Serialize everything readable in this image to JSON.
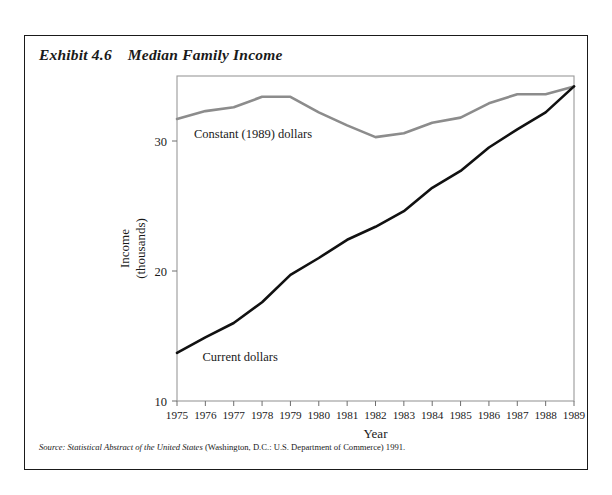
{
  "artifact": {
    "text": ""
  },
  "exhibit": {
    "number": "Exhibit 4.6",
    "title": "Median Family Income"
  },
  "source": {
    "label": "Source:",
    "work": "Statistical Abstract of the United States",
    "rest": "(Washington, D.C.: U.S. Department of Commerce) 1991."
  },
  "chart_data": {
    "type": "line",
    "title": "Median Family Income",
    "xlabel": "Year",
    "ylabel": "Income\n(thousands)",
    "ylabel_line1": "Income",
    "ylabel_line2": "(thousands)",
    "x": [
      1975,
      1976,
      1977,
      1978,
      1979,
      1980,
      1981,
      1982,
      1983,
      1984,
      1985,
      1986,
      1987,
      1988,
      1989
    ],
    "categories": [
      "1975",
      "1976",
      "1977",
      "1978",
      "1979",
      "1980",
      "1981",
      "1982",
      "1983",
      "1984",
      "1985",
      "1986",
      "1987",
      "1988",
      "1989"
    ],
    "xlim": [
      1975,
      1989
    ],
    "ylim": [
      10,
      35
    ],
    "yticks": [
      10,
      20,
      30
    ],
    "ytick_labels": [
      "10",
      "20",
      "30"
    ],
    "grid": false,
    "legend_position": "inline-annotations",
    "series": [
      {
        "name": "Constant (1989) dollars",
        "color": "#8c8c8c",
        "width": 2.6,
        "values": [
          31.7,
          32.3,
          32.6,
          33.4,
          33.4,
          32.2,
          31.2,
          30.3,
          30.6,
          31.4,
          31.8,
          32.9,
          33.6,
          33.6,
          34.2
        ]
      },
      {
        "name": "Current dollars",
        "color": "#111111",
        "width": 2.6,
        "values": [
          13.7,
          14.9,
          16.0,
          17.6,
          19.7,
          21.0,
          22.4,
          23.4,
          24.6,
          26.4,
          27.7,
          29.5,
          30.9,
          32.2,
          34.2
        ]
      }
    ],
    "annotations": [
      {
        "text": "Constant (1989) dollars",
        "x": 1975.6,
        "y": 30.2
      },
      {
        "text": "Current dollars",
        "x": 1975.9,
        "y": 13.1
      }
    ]
  }
}
